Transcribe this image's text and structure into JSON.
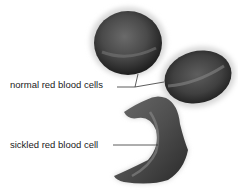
{
  "figure": {
    "labels": {
      "normal": "normal red blood cells",
      "sickled": "sickled red blood cell"
    },
    "colors": {
      "cell_dark": "#2a2a2a",
      "cell_mid": "#5a5a5a",
      "cell_light": "#8a8a8a",
      "leader_line": "#333333",
      "text": "#1a1a1a"
    }
  }
}
